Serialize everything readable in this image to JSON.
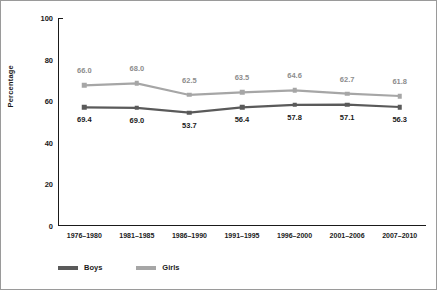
{
  "chart_data": {
    "type": "line",
    "title": "",
    "subtitle": "",
    "xlabel": "",
    "ylabel": "Percentage",
    "ylim": [
      0,
      100
    ],
    "yticks": [
      0,
      20,
      40,
      60,
      80,
      100
    ],
    "ytick_labels": [
      "0",
      "20",
      "40",
      "60",
      "80",
      "100"
    ],
    "grid": false,
    "legend_position": "bottom-left",
    "categories": [
      "1976–1980",
      "1981–1985",
      "1986–1990",
      "1991–1995",
      "1996–2000",
      "2001–2006",
      "2007–2010"
    ],
    "series": [
      {
        "name": "Boys",
        "color": "#5a5a5a",
        "marker": "square",
        "label_position": "below",
        "labels": [
          "69.4",
          "69.0",
          "53.7",
          "56.4",
          "57.8",
          "57.1",
          "56.3"
        ],
        "values": [
          57.0,
          56.8,
          54.5,
          57.0,
          58.2,
          58.4,
          57.2
        ]
      },
      {
        "name": "Girls",
        "color": "#a6a6a6",
        "marker": "square",
        "label_position": "above",
        "labels": [
          "66.0",
          "68.0",
          "62.5",
          "63.5",
          "64.6",
          "62.7",
          "61.8"
        ],
        "values": [
          67.6,
          68.6,
          63.0,
          64.2,
          65.2,
          63.6,
          62.5
        ]
      }
    ]
  },
  "legend": {
    "items": [
      {
        "label": "Boys",
        "color": "#5a5a5a"
      },
      {
        "label": "Girls",
        "color": "#a6a6a6"
      }
    ]
  },
  "colors": {
    "boys": "#5a5a5a",
    "girls": "#a6a6a6",
    "axis": "#1a1a1a",
    "background": "#ffffff",
    "border": "#9a9a9a"
  }
}
